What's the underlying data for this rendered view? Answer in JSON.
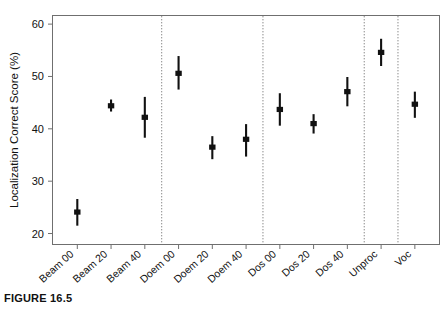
{
  "figure": {
    "caption": "FIGURE 16.5"
  },
  "chart_data": {
    "type": "scatter",
    "title": "",
    "xlabel": "",
    "ylabel": "Localization Correct Score (%)",
    "ylim": [
      18,
      61.5
    ],
    "yticks": [
      20,
      30,
      40,
      50,
      60
    ],
    "ytick_labels": [
      "20",
      "30",
      "40",
      "50",
      "60"
    ],
    "grid": false,
    "legend": "none",
    "error_bar_style": "vertical line with filled square marker at mean",
    "marker_color": "#111111",
    "categories": [
      "Beam 00",
      "Beam 20",
      "Beam 40",
      "Doem 00",
      "Doem 20",
      "Doem 40",
      "Dos 00",
      "Dos 20",
      "Dos 40",
      "Unproc",
      "Voc"
    ],
    "values": [
      24.1,
      44.4,
      42.2,
      50.6,
      36.5,
      38.0,
      43.7,
      41.0,
      47.1,
      54.6,
      44.7
    ],
    "err_low": [
      21.5,
      43.3,
      38.3,
      47.5,
      34.2,
      34.7,
      40.6,
      39.1,
      44.3,
      52.0,
      42.1
    ],
    "err_high": [
      26.6,
      45.6,
      46.1,
      53.9,
      38.6,
      40.9,
      46.8,
      42.8,
      49.9,
      57.2,
      47.1
    ],
    "separators_after": [
      "Beam 40",
      "Doem 40",
      "Dos 40",
      "Unproc"
    ],
    "separator_style": "dotted vertical line"
  }
}
